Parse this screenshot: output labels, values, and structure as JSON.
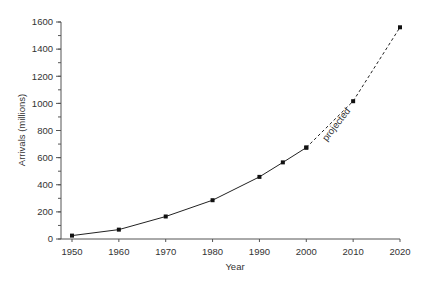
{
  "chart_data": {
    "type": "line",
    "title": "",
    "xlabel": "Year",
    "ylabel": "Arrivals (millions)",
    "xlim": [
      1950,
      2020
    ],
    "ylim": [
      0,
      1600
    ],
    "x_ticks": [
      1950,
      1960,
      1970,
      1980,
      1990,
      2000,
      2010,
      2020
    ],
    "y_ticks": [
      0,
      200,
      400,
      600,
      800,
      1000,
      1200,
      1400,
      1600
    ],
    "y_minor_step": 100,
    "grid": false,
    "legend": null,
    "series": [
      {
        "name": "Actual",
        "style": "solid",
        "marker": "square",
        "x": [
          1950,
          1960,
          1970,
          1980,
          1990,
          1995,
          2000
        ],
        "values": [
          25,
          69,
          166,
          286,
          458,
          565,
          674
        ]
      },
      {
        "name": "Projected",
        "style": "dashed",
        "marker": "square",
        "x": [
          2000,
          2010,
          2020
        ],
        "values": [
          674,
          1016,
          1561
        ]
      }
    ],
    "annotations": [
      {
        "text": "projected",
        "x": 2005,
        "y": 845,
        "rotation": -52
      }
    ]
  },
  "axis": {
    "x_title": "Year",
    "y_title": "Arrivals (millions)"
  }
}
